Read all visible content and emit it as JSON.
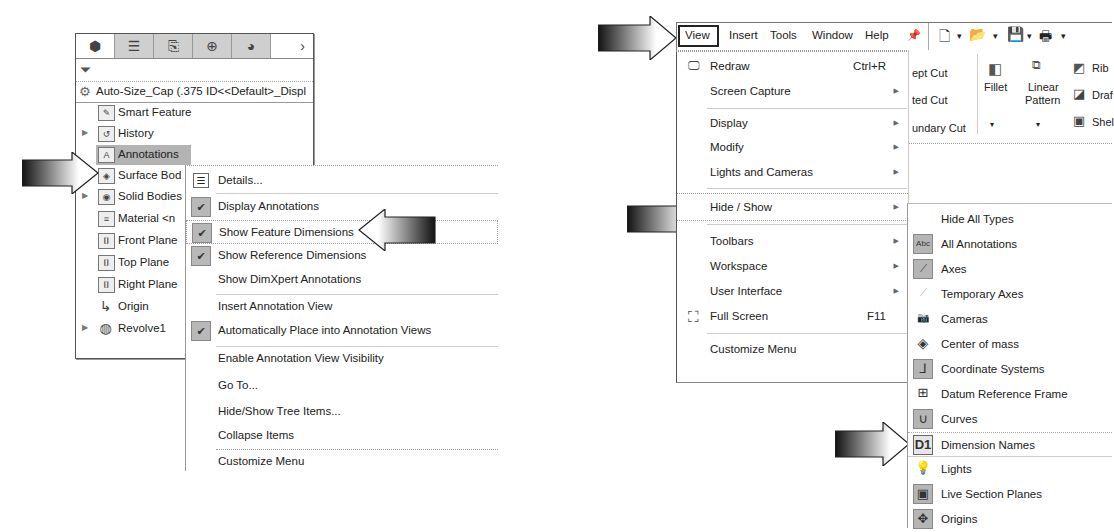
{
  "feature_manager": {
    "tabs": [
      {
        "icon": "feature-manager-tab-icon",
        "glyph": "⬢",
        "active": true
      },
      {
        "icon": "property-manager-tab-icon",
        "glyph": "☰",
        "active": false
      },
      {
        "icon": "configuration-manager-tab-icon",
        "glyph": "⎘",
        "active": false
      },
      {
        "icon": "dimxpert-manager-tab-icon",
        "glyph": "⊕",
        "active": false
      },
      {
        "icon": "display-manager-tab-icon",
        "glyph": "◕",
        "active": false
      }
    ],
    "more_tabs_glyph": "›",
    "filter_glyph": "⏷",
    "root_label": "Auto-Size_Cap  (.375 ID<<Default>_Displ",
    "tree_items": [
      {
        "label": "Smart Feature",
        "icon": "smart-feature-icon",
        "glyph": "✎",
        "expandable": false
      },
      {
        "label": "History",
        "icon": "history-icon",
        "glyph": "↺",
        "expandable": true
      },
      {
        "label": "Annotations",
        "icon": "annotations-icon",
        "glyph": "A",
        "expandable": false,
        "selected": true
      },
      {
        "label": "Surface Bod",
        "icon": "surface-bodies-icon",
        "glyph": "◈",
        "expandable": false
      },
      {
        "label": "Solid Bodies",
        "icon": "solid-bodies-icon",
        "glyph": "◉",
        "expandable": true
      },
      {
        "label": "Material <n",
        "icon": "material-icon",
        "glyph": "≡",
        "expandable": false
      },
      {
        "label": "Front Plane",
        "icon": "plane-icon",
        "glyph": "⌷",
        "expandable": false
      },
      {
        "label": "Top Plane",
        "icon": "plane-icon",
        "glyph": "⌷",
        "expandable": false
      },
      {
        "label": "Right Plane",
        "icon": "plane-icon",
        "glyph": "⌷",
        "expandable": false
      },
      {
        "label": "Origin",
        "icon": "origin-icon",
        "glyph": "↳",
        "expandable": false
      },
      {
        "label": "Revolve1",
        "icon": "revolve-icon",
        "glyph": "◍",
        "expandable": true
      }
    ]
  },
  "context_menu": {
    "items": [
      {
        "label": "Details...",
        "icon": "details-icon",
        "checked": false
      },
      {
        "label": "Display Annotations",
        "checked": true
      },
      {
        "label": "Show Feature Dimensions",
        "checked": true,
        "highlighted": true
      },
      {
        "label": "Show Reference Dimensions",
        "checked": true
      },
      {
        "label": "Show DimXpert Annotations",
        "checked": false
      },
      {
        "label": "Insert Annotation View",
        "checked": false
      },
      {
        "label": "Automatically Place into Annotation Views",
        "checked": true
      },
      {
        "label": "Enable Annotation View Visibility",
        "checked": false
      },
      {
        "label": "Go To...",
        "checked": false
      },
      {
        "label": "Hide/Show Tree Items...",
        "checked": false
      },
      {
        "label": "Collapse Items",
        "checked": false
      },
      {
        "label": "Customize Menu",
        "checked": false
      }
    ],
    "check_glyph": "✔"
  },
  "menu_bar": {
    "items": [
      "View",
      "Insert",
      "Tools",
      "Window",
      "Help"
    ],
    "active": "View",
    "pin_glyph": "📌",
    "toolbar_glyphs": [
      "🗋",
      "▾",
      "📂",
      "▾",
      "💾",
      "▾",
      "🖶",
      "▾"
    ]
  },
  "command_manager": {
    "partial_labels": [
      "ept Cut",
      "ted Cut",
      "undary Cut"
    ],
    "fillet": "Fillet",
    "linear_pattern_1": "Linear",
    "linear_pattern_2": "Pattern",
    "rib": "Rib",
    "draft": "Draf",
    "shell": "Shel",
    "dropdown_glyph": "▾"
  },
  "view_menu": {
    "items": [
      {
        "label": "Redraw",
        "shortcut": "Ctrl+R",
        "icon": "redraw-icon",
        "glyph": "🖵",
        "submenu": false
      },
      {
        "label": "Screen Capture",
        "shortcut": "",
        "submenu": true
      },
      {
        "label": "Display",
        "shortcut": "",
        "submenu": true
      },
      {
        "label": "Modify",
        "shortcut": "",
        "submenu": true
      },
      {
        "label": "Lights and Cameras",
        "shortcut": "",
        "submenu": true
      },
      {
        "label": "Hide / Show",
        "shortcut": "",
        "submenu": true,
        "highlighted": true
      },
      {
        "label": "Toolbars",
        "shortcut": "",
        "submenu": true
      },
      {
        "label": "Workspace",
        "shortcut": "",
        "submenu": true
      },
      {
        "label": "User Interface",
        "shortcut": "",
        "submenu": true
      },
      {
        "label": "Full Screen",
        "shortcut": "F11",
        "icon": "full-screen-icon",
        "glyph": "⛶",
        "submenu": false
      },
      {
        "label": "Customize Menu",
        "shortcut": "",
        "submenu": false
      }
    ],
    "submenu_glyph": "▶"
  },
  "hide_show_menu": {
    "items": [
      {
        "label": "Hide All Types",
        "icon": "",
        "glyph": "",
        "on": false
      },
      {
        "label": "All Annotations",
        "icon": "all-annotations-icon",
        "glyph": "Abc",
        "on": true
      },
      {
        "label": "Axes",
        "icon": "axes-icon",
        "glyph": "⟋",
        "on": true
      },
      {
        "label": "Temporary Axes",
        "icon": "temporary-axes-icon",
        "glyph": "⟋",
        "on": false
      },
      {
        "label": "Cameras",
        "icon": "cameras-icon",
        "glyph": "📷",
        "on": false
      },
      {
        "label": "Center of mass",
        "icon": "center-of-mass-icon",
        "glyph": "◈",
        "on": false
      },
      {
        "label": "Coordinate Systems",
        "icon": "coordinate-systems-icon",
        "glyph": "⅃",
        "on": true
      },
      {
        "label": "Datum Reference Frame",
        "icon": "datum-reference-frame-icon",
        "glyph": "⊞",
        "on": false
      },
      {
        "label": "Curves",
        "icon": "curves-icon",
        "glyph": "∪",
        "on": true
      },
      {
        "label": "Dimension Names",
        "icon": "dimension-names-icon",
        "glyph": "D1",
        "on": false,
        "highlighted": true
      },
      {
        "label": "Lights",
        "icon": "lights-icon",
        "glyph": "💡",
        "on": false
      },
      {
        "label": "Live Section Planes",
        "icon": "live-section-planes-icon",
        "glyph": "▣",
        "on": true
      },
      {
        "label": "Origins",
        "icon": "origins-icon",
        "glyph": "✥",
        "on": true
      }
    ]
  }
}
